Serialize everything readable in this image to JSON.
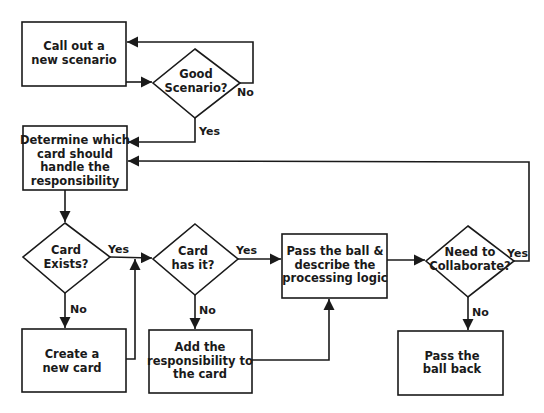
{
  "diagram": {
    "type": "flowchart",
    "colors": {
      "stroke": "#1a1a1a",
      "fill": "#ffffff",
      "text": "#1a1a1a"
    },
    "nodes": {
      "call_out": {
        "shape": "rect",
        "lines": [
          "Call out a",
          "new scenario"
        ]
      },
      "good_scenario": {
        "shape": "diamond",
        "lines": [
          "Good",
          "Scenario?"
        ]
      },
      "determine_card": {
        "shape": "rect",
        "lines": [
          "Determine which",
          "card should",
          "handle the",
          "responsibility"
        ]
      },
      "card_exists": {
        "shape": "diamond",
        "lines": [
          "Card",
          "Exists?"
        ]
      },
      "create_card": {
        "shape": "rect",
        "lines": [
          "Create a",
          "new card"
        ]
      },
      "card_has_it": {
        "shape": "diamond",
        "lines": [
          "Card",
          "has it?"
        ]
      },
      "add_responsibility": {
        "shape": "rect",
        "lines": [
          "Add the",
          "responsibility to",
          "the card"
        ]
      },
      "pass_ball": {
        "shape": "rect",
        "lines": [
          "Pass the ball &",
          "describe the",
          "processing logic"
        ]
      },
      "need_collaborate": {
        "shape": "diamond",
        "lines": [
          "Need to",
          "Collaborate?"
        ]
      },
      "pass_back": {
        "shape": "rect",
        "lines": [
          "Pass the",
          "ball back"
        ]
      }
    },
    "edges": [
      {
        "from": "call_out",
        "to": "good_scenario",
        "label": ""
      },
      {
        "from": "good_scenario",
        "to": "call_out",
        "label": "No"
      },
      {
        "from": "good_scenario",
        "to": "determine_card",
        "label": "Yes"
      },
      {
        "from": "determine_card",
        "to": "card_exists",
        "label": ""
      },
      {
        "from": "card_exists",
        "to": "card_has_it",
        "label": "Yes"
      },
      {
        "from": "card_exists",
        "to": "create_card",
        "label": "No"
      },
      {
        "from": "create_card",
        "to": "card_has_it",
        "label": ""
      },
      {
        "from": "card_has_it",
        "to": "pass_ball",
        "label": "Yes"
      },
      {
        "from": "card_has_it",
        "to": "add_responsibility",
        "label": "No"
      },
      {
        "from": "add_responsibility",
        "to": "pass_ball",
        "label": ""
      },
      {
        "from": "pass_ball",
        "to": "need_collaborate",
        "label": ""
      },
      {
        "from": "need_collaborate",
        "to": "determine_card",
        "label": "Yes"
      },
      {
        "from": "need_collaborate",
        "to": "pass_back",
        "label": "No"
      }
    ],
    "edge_labels": {
      "good_no": "No",
      "good_yes": "Yes",
      "exists_yes": "Yes",
      "exists_no": "No",
      "has_yes": "Yes",
      "has_no": "No",
      "collab_yes": "Yes",
      "collab_no": "No"
    }
  }
}
